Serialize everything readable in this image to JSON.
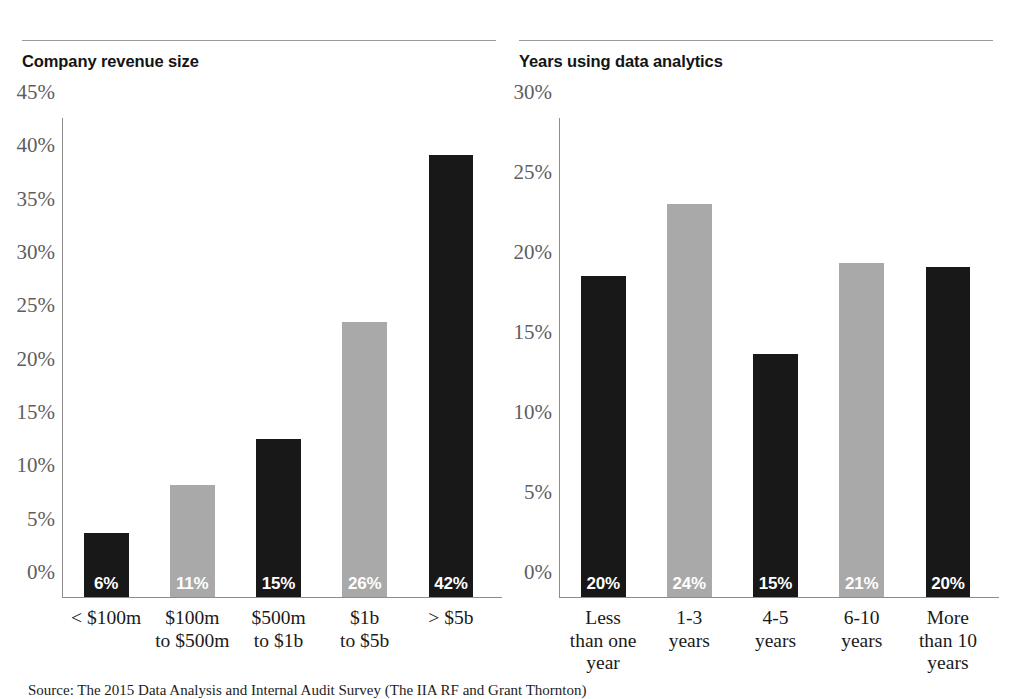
{
  "footnote": "Source: The 2015 Data Analysis and Internal Audit Survey (The IIA RF and Grant Thornton)",
  "panels": [
    {
      "title": "Company revenue size"
    },
    {
      "title": "Years using data analytics"
    }
  ],
  "chart_data": [
    {
      "type": "bar",
      "title": "Company revenue size",
      "xlabel": "",
      "ylabel": "",
      "ylim": [
        0,
        45
      ],
      "grid": false,
      "legend": "none",
      "categories": [
        "< $100m",
        "$100m\nto $500m",
        "$500m\nto $1b",
        "$1b\nto $5b",
        "> $5b"
      ],
      "values": [
        6.0,
        10.5,
        14.8,
        25.8,
        41.5
      ],
      "data_labels": [
        "6%",
        "11%",
        "15%",
        "26%",
        "42%"
      ],
      "bar_colors": [
        "#181818",
        "#a9a9a9",
        "#181818",
        "#a9a9a9",
        "#181818"
      ],
      "yticks": [
        "0%",
        "5%",
        "10%",
        "15%",
        "20%",
        "25%",
        "30%",
        "35%",
        "40%",
        "45%"
      ],
      "ytick_values": [
        0,
        5,
        10,
        15,
        20,
        25,
        30,
        35,
        40,
        45
      ]
    },
    {
      "type": "bar",
      "title": "Years using data analytics",
      "xlabel": "",
      "ylabel": "",
      "ylim": [
        0,
        30
      ],
      "grid": false,
      "legend": "none",
      "categories": [
        "Less\nthan one\nyear",
        "1-3\nyears",
        "4-5\nyears",
        "6-10\nyears",
        "More\nthan 10\nyears"
      ],
      "values": [
        20.1,
        24.6,
        15.2,
        20.9,
        20.7
      ],
      "data_labels": [
        "20%",
        "24%",
        "15%",
        "21%",
        "20%"
      ],
      "bar_colors": [
        "#181818",
        "#a9a9a9",
        "#181818",
        "#a9a9a9",
        "#181818"
      ],
      "yticks": [
        "0%",
        "5%",
        "10%",
        "15%",
        "20%",
        "25%",
        "30%"
      ],
      "ytick_values": [
        0,
        5,
        10,
        15,
        20,
        25,
        30
      ]
    }
  ]
}
